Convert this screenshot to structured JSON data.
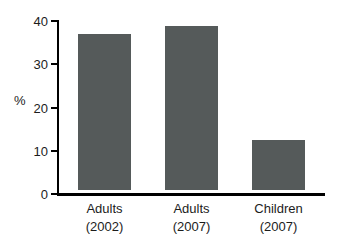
{
  "chart_data": {
    "type": "bar",
    "title": "",
    "xlabel": "",
    "ylabel": "%",
    "categories": [
      "Adults\n(2002)",
      "Adults\n(2007)",
      "Children\n(2007)"
    ],
    "category_lines": [
      [
        "Adults",
        "(2002)"
      ],
      [
        "Adults",
        "(2007)"
      ],
      [
        "Children",
        "(2007)"
      ]
    ],
    "values": [
      36,
      38,
      11.5
    ],
    "ylim": [
      0,
      40
    ],
    "yticks": [
      0,
      10,
      20,
      30,
      40
    ],
    "ytick_labels": [
      "0",
      "10",
      "20",
      "30",
      "40"
    ],
    "grid": false,
    "legend": false,
    "bar_color": "#555a5a",
    "axis_color": "#000000",
    "background_color": "#ffffff"
  }
}
